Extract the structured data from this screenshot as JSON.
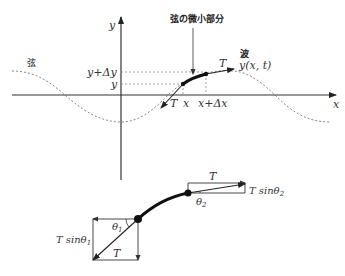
{
  "upper_diagram": {
    "axes": {
      "x_label": "x",
      "y_label": "y"
    },
    "string_label": "弦",
    "segment_label": "弦の微小部分",
    "wave_label": "波",
    "wave_function": "y(x, t)",
    "y_labels": {
      "y": "y",
      "y_plus_dy": "y+Δy"
    },
    "x_labels": {
      "x": "x",
      "x_plus_dx": "x+Δx"
    },
    "tension_left": "T",
    "tension_right": "T"
  },
  "lower_diagram": {
    "left": {
      "tension": "T",
      "horizontal": "T",
      "vertical": "T sinθ",
      "vertical_sub": "1",
      "angle": "θ",
      "angle_sub": "1"
    },
    "right": {
      "tension": "T",
      "horizontal": "T",
      "vertical": "T sinθ",
      "vertical_sub": "2",
      "angle": "θ",
      "angle_sub": "2"
    }
  },
  "colors": {
    "line": "#333333",
    "dashed": "#888888",
    "segment": "#111111"
  }
}
